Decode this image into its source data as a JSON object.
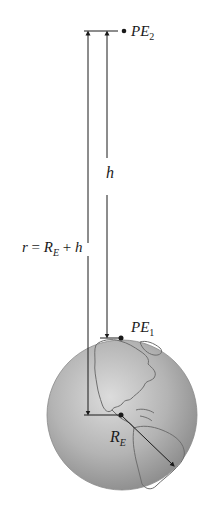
{
  "diagram": {
    "labels": {
      "pe2": {
        "main": "PE",
        "sub": "2"
      },
      "pe1": {
        "main": "PE",
        "sub": "1"
      },
      "h": "h",
      "r_eq": {
        "r": "r",
        "eq": " = ",
        "R": "R",
        "sub": "E",
        "plus": " + ",
        "h": "h"
      },
      "re": {
        "main": "R",
        "sub": "E"
      }
    },
    "colors": {
      "line": "#1a1a1a",
      "earth_light": "#d6d6d6",
      "earth_mid": "#a8a8a8",
      "earth_dark": "#7a7a7a",
      "continent_outline": "#6e6e6e",
      "background": "#ffffff"
    },
    "points": {
      "pe2": {
        "x": 124,
        "y": 31
      },
      "pe1": {
        "x": 121,
        "y": 338
      },
      "earth_center": {
        "x": 121,
        "y": 415
      }
    },
    "earth": {
      "cx": 122,
      "cy": 415,
      "r": 75
    }
  }
}
